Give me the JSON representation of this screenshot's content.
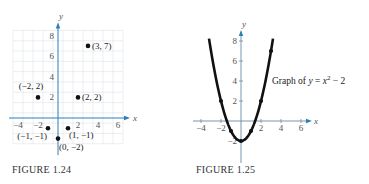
{
  "chart_data": [
    {
      "type": "scatter",
      "caption": "FIGURE 1.24",
      "xlabel": "x",
      "ylabel": "y",
      "grid": true,
      "xlim": [
        -4.5,
        6.5
      ],
      "ylim": [
        -2.5,
        8.5
      ],
      "xticks": [
        -4,
        -2,
        2,
        4,
        6
      ],
      "xtick_labels": [
        "−4",
        "−2",
        "2",
        "4",
        "6"
      ],
      "yticks": [
        2,
        4,
        6,
        8
      ],
      "ytick_labels": [
        "2",
        "4",
        "6",
        "8"
      ],
      "points": [
        {
          "x": 3,
          "y": 7,
          "label": "(3, 7)",
          "label_pos": "right"
        },
        {
          "x": -2,
          "y": 2,
          "label": "(−2, 2)",
          "label_pos": "top-left"
        },
        {
          "x": 2,
          "y": 2,
          "label": "(2, 2)",
          "label_pos": "right"
        },
        {
          "x": -1,
          "y": -1,
          "label": "(−1, −1)",
          "label_pos": "bottom-left"
        },
        {
          "x": 1,
          "y": -1,
          "label": "(1, −1)",
          "label_pos": "bottom-right"
        },
        {
          "x": 0,
          "y": -2,
          "label": "(0, −2)",
          "label_pos": "bottom-right"
        }
      ]
    },
    {
      "type": "line",
      "caption": "FIGURE 1.25",
      "xlabel": "x",
      "ylabel": "y",
      "grid": false,
      "function": "y = x^2 - 2",
      "annotation": {
        "prefix": "Graph of ",
        "var": "y",
        "eq": " = ",
        "base": "x",
        "exp": "2",
        "suffix": " − 2"
      },
      "xlim": [
        -4.5,
        6.5
      ],
      "ylim": [
        -4,
        9
      ],
      "curve_x_range": [
        -3.2,
        3.2
      ],
      "xticks": [
        -4,
        -2,
        2,
        4,
        6
      ],
      "xtick_labels": [
        "−4",
        "−2",
        "2",
        "4",
        "6"
      ],
      "yticks": [
        -2,
        2,
        4,
        6,
        8
      ],
      "ytick_labels": [
        "−2",
        "2",
        "4",
        "6",
        "8"
      ],
      "points": [
        {
          "x": -2,
          "y": 2
        },
        {
          "x": -1,
          "y": -1
        },
        {
          "x": 0,
          "y": -2
        },
        {
          "x": 1,
          "y": -1
        },
        {
          "x": 2,
          "y": 2
        },
        {
          "x": 3,
          "y": 7
        }
      ]
    }
  ]
}
